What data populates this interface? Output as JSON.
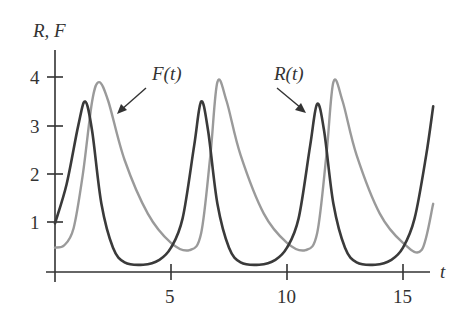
{
  "chart_data": {
    "type": "line",
    "title": "",
    "xlabel": "t",
    "ylabel": "R, F",
    "xlim": [
      0,
      16.5
    ],
    "ylim": [
      0,
      4.5
    ],
    "x_ticks": [
      5,
      10,
      15
    ],
    "y_ticks": [
      1,
      2,
      3,
      4
    ],
    "grid": false,
    "legend": "none (curves labeled with arrow annotations)",
    "annotations": [
      {
        "text": "F(t)",
        "points_to": "light gray curve near first F peak descending side (t≈2.6, y≈3.0)"
      },
      {
        "text": "R(t)",
        "points_to": "dark curve near third R peak (t≈10.9, y≈3.2)"
      }
    ],
    "series": [
      {
        "name": "R(t)",
        "color": "#3a3a3a",
        "x": [
          0,
          0.5,
          1.0,
          1.3,
          1.6,
          2.0,
          2.5,
          3.0,
          3.8,
          4.5,
          5.0,
          5.5,
          6.0,
          6.3,
          6.6,
          7.0,
          7.5,
          8.0,
          8.8,
          9.5,
          10.0,
          10.5,
          11.0,
          11.3,
          11.6,
          12.0,
          12.5,
          13.0,
          13.8,
          14.5,
          15.0,
          15.5,
          16.0,
          16.3
        ],
        "values": [
          1.0,
          1.8,
          3.0,
          3.5,
          2.9,
          1.4,
          0.5,
          0.2,
          0.15,
          0.25,
          0.5,
          1.1,
          2.6,
          3.5,
          2.9,
          1.4,
          0.5,
          0.2,
          0.15,
          0.25,
          0.5,
          1.1,
          2.6,
          3.45,
          2.9,
          1.4,
          0.5,
          0.2,
          0.15,
          0.25,
          0.5,
          1.1,
          2.4,
          3.4
        ]
      },
      {
        "name": "F(t)",
        "color": "#9a9a9a",
        "x": [
          0,
          0.4,
          0.8,
          1.2,
          1.6,
          1.9,
          2.3,
          3.0,
          4.0,
          5.0,
          5.8,
          6.3,
          6.7,
          7.0,
          7.4,
          8.0,
          9.0,
          10.0,
          10.8,
          11.3,
          11.7,
          12.0,
          12.4,
          13.0,
          14.0,
          15.0,
          15.8,
          16.3
        ],
        "values": [
          0.5,
          0.55,
          0.9,
          2.0,
          3.5,
          3.9,
          3.5,
          2.3,
          1.2,
          0.6,
          0.45,
          0.8,
          2.4,
          3.9,
          3.5,
          2.4,
          1.2,
          0.6,
          0.45,
          0.8,
          2.4,
          3.9,
          3.5,
          2.4,
          1.2,
          0.6,
          0.45,
          1.4
        ]
      }
    ]
  },
  "labels": {
    "y_axis": "R, F",
    "x_axis": "t",
    "annotation_F": "F(t)",
    "annotation_R": "R(t)",
    "ytick_1": "1",
    "ytick_2": "2",
    "ytick_3": "3",
    "ytick_4": "4",
    "xtick_5": "5",
    "xtick_10": "10",
    "xtick_15": "15"
  }
}
